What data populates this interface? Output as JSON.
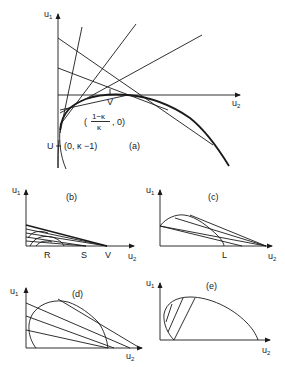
{
  "figure": {
    "panels": [
      {
        "id": "a",
        "label": "(a)",
        "axes": {
          "y": "u",
          "y_sub": "1",
          "x": "u",
          "x_sub": "2"
        },
        "points": {
          "V": "V",
          "U": "U",
          "U_coord": "(0, κ −1)",
          "V_coord_open": "(",
          "V_coord_num": "1−κ",
          "V_coord_den": "κ",
          "V_coord_close": ", 0)"
        }
      },
      {
        "id": "b",
        "label": "(b)",
        "axes": {
          "y": "u",
          "y_sub": "1",
          "x": "u",
          "x_sub": "2"
        },
        "points": {
          "R": "R",
          "S": "S",
          "V": "V"
        }
      },
      {
        "id": "c",
        "label": "(c)",
        "axes": {
          "y": "u",
          "y_sub": "1",
          "x": "u",
          "x_sub": "2"
        },
        "points": {
          "L": "L"
        }
      },
      {
        "id": "d",
        "label": "(d)",
        "axes": {
          "y": "u",
          "y_sub": "1",
          "x": "u",
          "x_sub": "2"
        }
      },
      {
        "id": "e",
        "label": "(e)",
        "axes": {
          "y": "u",
          "y_sub": "1",
          "x": "u",
          "x_sub": "2"
        }
      }
    ],
    "ink_color": "#1a1a1a",
    "background": "#ffffff"
  }
}
